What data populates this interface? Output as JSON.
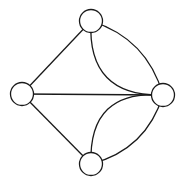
{
  "diagram": {
    "type": "graph",
    "width": 183,
    "height": 186,
    "stroke_color": "#1a1a1a",
    "node_fill": "#ffffff",
    "node_radius": 11.5,
    "nodes": [
      {
        "id": "top",
        "x": 91,
        "y": 21
      },
      {
        "id": "left",
        "x": 22,
        "y": 94
      },
      {
        "id": "right",
        "x": 163,
        "y": 95
      },
      {
        "id": "bottom",
        "x": 91,
        "y": 164
      }
    ],
    "edges": [
      {
        "from": "left",
        "to": "top",
        "curve": 0
      },
      {
        "from": "left",
        "to": "right",
        "curve": 0
      },
      {
        "from": "left",
        "to": "bottom",
        "curve": 0
      },
      {
        "from": "top",
        "to": "right",
        "curve": 28
      },
      {
        "from": "top",
        "to": "right",
        "curve": -14
      },
      {
        "from": "bottom",
        "to": "right",
        "curve": -28
      },
      {
        "from": "bottom",
        "to": "right",
        "curve": 14
      }
    ]
  }
}
